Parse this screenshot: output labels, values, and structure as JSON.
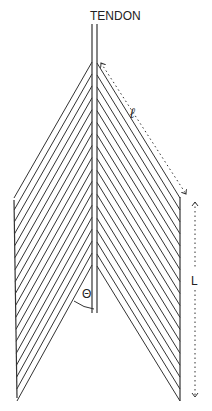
{
  "diagram": {
    "type": "unipennate-bipennate muscle fiber diagram",
    "labels": {
      "tendon": "TENDON",
      "fiber_length": "ℓ",
      "muscle_length": "L",
      "pennation_angle": "Θ"
    },
    "fibers_per_side": 18,
    "colors": {
      "line": "#333333",
      "background": "#ffffff"
    }
  }
}
